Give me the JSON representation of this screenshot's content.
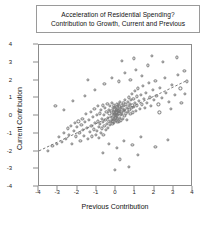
{
  "chart_data": {
    "type": "scatter",
    "title": "Acceleration of Residential Spending?",
    "subtitle": "Contribution to Growth, Current and Previous",
    "xlabel": "Previous Contribution",
    "ylabel": "Current Contribution",
    "xlim": [
      -4,
      4
    ],
    "ylim": [
      -4,
      4
    ],
    "xticks": [
      "-4",
      "-3",
      "-2",
      "-1",
      "0",
      "1",
      "2",
      "3",
      "4"
    ],
    "yticks": [
      "4",
      "3",
      "2",
      "1",
      "0",
      "-1",
      "-2",
      "-3",
      "-4"
    ],
    "xtick_values": [
      -4,
      -3,
      -2,
      -1,
      0,
      1,
      2,
      3,
      4
    ],
    "ytick_values": [
      4,
      3,
      2,
      1,
      0,
      -1,
      -2,
      -3,
      -4
    ],
    "grid": false,
    "legend": "none",
    "marker": "open-circle",
    "marker_color": "#777777",
    "trendline": {
      "style": "dashed",
      "color": "#666666",
      "x0": -4.0,
      "y0": -2.05,
      "x1": 3.75,
      "y1": 1.95
    },
    "points": [
      [
        -3.55,
        -1.95
      ],
      [
        -3.3,
        -1.7
      ],
      [
        -3.05,
        -1.55
      ],
      [
        -2.95,
        -1.2
      ],
      [
        -2.8,
        -1.45
      ],
      [
        -2.7,
        -0.95
      ],
      [
        -2.6,
        -1.3
      ],
      [
        -2.5,
        -0.7
      ],
      [
        -2.45,
        -1.05
      ],
      [
        -2.35,
        -0.55
      ],
      [
        -2.3,
        -1.55
      ],
      [
        -2.2,
        -0.85
      ],
      [
        -2.15,
        -0.4
      ],
      [
        -2.1,
        -1.15
      ],
      [
        -2.05,
        -0.6
      ],
      [
        -1.95,
        -0.3
      ],
      [
        -1.9,
        -0.95
      ],
      [
        -1.85,
        -1.4
      ],
      [
        -1.8,
        -0.5
      ],
      [
        -1.75,
        -0.15
      ],
      [
        -1.7,
        -0.8
      ],
      [
        -1.65,
        -1.1
      ],
      [
        -1.6,
        -0.35
      ],
      [
        -1.55,
        0.1
      ],
      [
        -1.5,
        -0.65
      ],
      [
        -1.45,
        -1.3
      ],
      [
        -1.4,
        -0.2
      ],
      [
        -1.35,
        -0.9
      ],
      [
        -1.3,
        0.25
      ],
      [
        -1.28,
        -0.55
      ],
      [
        -1.25,
        -1.15
      ],
      [
        -1.2,
        -0.05
      ],
      [
        -1.15,
        -0.75
      ],
      [
        -1.12,
        0.4
      ],
      [
        -1.08,
        -0.4
      ],
      [
        -1.05,
        -1.05
      ],
      [
        -1.0,
        0.05
      ],
      [
        -0.98,
        -0.85
      ],
      [
        -0.95,
        -0.3
      ],
      [
        -0.92,
        0.55
      ],
      [
        -0.9,
        -0.6
      ],
      [
        -0.88,
        -1.25
      ],
      [
        -0.85,
        0.15
      ],
      [
        -0.82,
        -0.45
      ],
      [
        -0.8,
        -0.95
      ],
      [
        -0.78,
        0.35
      ],
      [
        -0.75,
        -0.15
      ],
      [
        -0.72,
        -0.7
      ],
      [
        -0.7,
        0.6
      ],
      [
        -0.68,
        -0.35
      ],
      [
        -0.65,
        -1.05
      ],
      [
        -0.62,
        0.05
      ],
      [
        -0.6,
        -0.55
      ],
      [
        -0.58,
        0.45
      ],
      [
        -0.55,
        -0.2
      ],
      [
        -0.52,
        -0.8
      ],
      [
        -0.5,
        0.25
      ],
      [
        -0.48,
        -0.45
      ],
      [
        -0.45,
        0.7
      ],
      [
        -0.43,
        -0.1
      ],
      [
        -0.4,
        -0.65
      ],
      [
        -0.38,
        0.35
      ],
      [
        -0.36,
        -0.3
      ],
      [
        -0.34,
        0.15
      ],
      [
        -0.32,
        -0.5
      ],
      [
        -0.3,
        0.55
      ],
      [
        -0.28,
        -0.05
      ],
      [
        -0.26,
        -0.35
      ],
      [
        -0.24,
        0.3
      ],
      [
        -0.22,
        -0.2
      ],
      [
        -0.2,
        0.75
      ],
      [
        -0.19,
        -0.45
      ],
      [
        -0.18,
        0.1
      ],
      [
        -0.16,
        -0.15
      ],
      [
        -0.15,
        0.45
      ],
      [
        -0.14,
        -0.3
      ],
      [
        -0.12,
        0.2
      ],
      [
        -0.11,
        -0.05
      ],
      [
        -0.1,
        0.6
      ],
      [
        -0.09,
        -0.4
      ],
      [
        -0.08,
        0.35
      ],
      [
        -0.07,
        0.05
      ],
      [
        -0.06,
        -0.2
      ],
      [
        -0.05,
        0.5
      ],
      [
        -0.04,
        0.15
      ],
      [
        -0.03,
        -0.1
      ],
      [
        -0.02,
        0.3
      ],
      [
        -0.01,
        0.0
      ],
      [
        0.0,
        0.45
      ],
      [
        0.01,
        -0.25
      ],
      [
        0.02,
        0.2
      ],
      [
        0.03,
        0.65
      ],
      [
        0.04,
        -0.05
      ],
      [
        0.05,
        0.35
      ],
      [
        0.06,
        0.1
      ],
      [
        0.07,
        -0.35
      ],
      [
        0.08,
        0.55
      ],
      [
        0.09,
        0.25
      ],
      [
        0.1,
        -0.15
      ],
      [
        0.11,
        0.4
      ],
      [
        0.12,
        0.05
      ],
      [
        0.13,
        0.7
      ],
      [
        0.14,
        -0.3
      ],
      [
        0.15,
        0.3
      ],
      [
        0.16,
        0.15
      ],
      [
        0.18,
        0.5
      ],
      [
        0.19,
        -0.1
      ],
      [
        0.2,
        0.35
      ],
      [
        0.22,
        0.8
      ],
      [
        0.24,
        0.05
      ],
      [
        0.25,
        0.45
      ],
      [
        0.26,
        -0.25
      ],
      [
        0.28,
        0.25
      ],
      [
        0.3,
        0.6
      ],
      [
        0.32,
        0.1
      ],
      [
        0.34,
        0.4
      ],
      [
        0.36,
        -0.15
      ],
      [
        0.38,
        0.75
      ],
      [
        0.4,
        0.3
      ],
      [
        0.42,
        0.55
      ],
      [
        0.44,
        0.0
      ],
      [
        0.46,
        0.9
      ],
      [
        0.48,
        0.35
      ],
      [
        0.5,
        0.65
      ],
      [
        0.52,
        0.15
      ],
      [
        0.55,
        0.45
      ],
      [
        0.58,
        -0.2
      ],
      [
        0.6,
        0.8
      ],
      [
        0.62,
        0.25
      ],
      [
        0.65,
        0.55
      ],
      [
        0.68,
        1.05
      ],
      [
        0.7,
        0.35
      ],
      [
        0.72,
        0.7
      ],
      [
        0.75,
        0.1
      ],
      [
        0.78,
        0.9
      ],
      [
        0.8,
        0.45
      ],
      [
        0.82,
        1.25
      ],
      [
        0.85,
        0.6
      ],
      [
        0.88,
        0.2
      ],
      [
        0.9,
        0.95
      ],
      [
        0.95,
        0.5
      ],
      [
        0.98,
        1.4
      ],
      [
        1.0,
        0.75
      ],
      [
        1.05,
        0.3
      ],
      [
        1.08,
        1.1
      ],
      [
        1.1,
        0.6
      ],
      [
        1.15,
        1.55
      ],
      [
        1.2,
        0.85
      ],
      [
        1.25,
        0.4
      ],
      [
        1.3,
        1.2
      ],
      [
        1.35,
        0.65
      ],
      [
        1.4,
        1.7
      ],
      [
        1.45,
        0.95
      ],
      [
        1.5,
        0.45
      ],
      [
        1.55,
        1.3
      ],
      [
        1.6,
        0.75
      ],
      [
        1.7,
        1.85
      ],
      [
        1.75,
        1.05
      ],
      [
        1.8,
        0.55
      ],
      [
        1.9,
        1.45
      ],
      [
        1.95,
        0.9
      ],
      [
        2.05,
        2.0
      ],
      [
        2.1,
        1.15
      ],
      [
        2.2,
        0.65
      ],
      [
        2.3,
        1.6
      ],
      [
        2.4,
        1.0
      ],
      [
        2.55,
        2.15
      ],
      [
        2.6,
        1.3
      ],
      [
        2.75,
        0.8
      ],
      [
        2.9,
        1.75
      ],
      [
        3.05,
        1.2
      ],
      [
        3.2,
        2.3
      ],
      [
        3.35,
        1.55
      ],
      [
        3.55,
        2.55
      ],
      [
        3.7,
        1.95
      ],
      [
        -1.6,
        1.15
      ],
      [
        -1.1,
        1.45
      ],
      [
        -0.6,
        1.8
      ],
      [
        -0.2,
        2.15
      ],
      [
        0.15,
        1.95
      ],
      [
        0.45,
        2.45
      ],
      [
        0.75,
        2.05
      ],
      [
        1.05,
        2.6
      ],
      [
        1.35,
        2.25
      ],
      [
        1.65,
        2.85
      ],
      [
        0.3,
        3.1
      ],
      [
        0.95,
        3.25
      ],
      [
        1.85,
        3.4
      ],
      [
        2.45,
        3.05
      ],
      [
        3.15,
        3.3
      ],
      [
        -0.35,
        -1.55
      ],
      [
        0.05,
        -1.8
      ],
      [
        0.4,
        -1.4
      ],
      [
        0.85,
        -1.65
      ],
      [
        1.3,
        -1.2
      ],
      [
        -0.7,
        -2.1
      ],
      [
        0.2,
        -2.45
      ],
      [
        1.15,
        -2.2
      ],
      [
        2.05,
        -1.75
      ],
      [
        2.7,
        -1.35
      ],
      [
        -0.05,
        -3.05
      ],
      [
        0.65,
        -2.85
      ],
      [
        -2.25,
        0.85
      ],
      [
        -2.7,
        0.35
      ],
      [
        -3.15,
        0.55
      ],
      [
        2.25,
        0.2
      ],
      [
        2.85,
        0.4
      ],
      [
        3.4,
        0.75
      ],
      [
        3.6,
        1.25
      ],
      [
        -1.45,
        2.05
      ]
    ]
  }
}
